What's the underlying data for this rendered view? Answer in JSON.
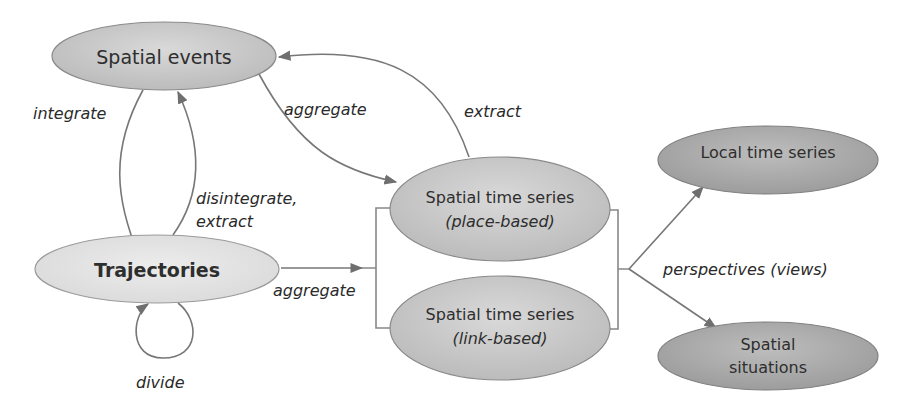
{
  "nodes": {
    "spatial_events": {
      "label": "Spatial events"
    },
    "trajectories": {
      "label": "Trajectories"
    },
    "sts_place": {
      "line1": "Spatial time series",
      "line2": "(place-based)"
    },
    "sts_link": {
      "line1": "Spatial time series",
      "line2": "(link-based)"
    },
    "local_ts": {
      "label": "Local time series"
    },
    "spatial_situations": {
      "line1": "Spatial",
      "line2": "situations"
    }
  },
  "edges": {
    "integrate": "integrate",
    "disintegrate_line1": "disintegrate,",
    "disintegrate_line2": "extract",
    "aggregate_events": "aggregate",
    "extract": "extract",
    "aggregate_trajectories": "aggregate",
    "divide": "divide",
    "perspectives": "perspectives (views)"
  },
  "colors": {
    "light_fill": "#e4e4e4",
    "mid_fill": "#c9c9c9",
    "dark_fill": "#a9a9a9",
    "stroke": "#8a8a8a",
    "edge": "#777777"
  }
}
